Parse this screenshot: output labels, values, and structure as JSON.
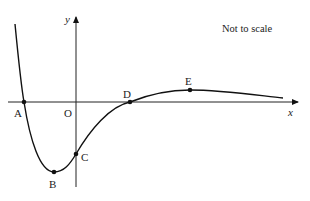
{
  "diagram": {
    "note": "Not to scale",
    "axes": {
      "x_label": "x",
      "y_label": "y",
      "origin_label": "O"
    },
    "points": [
      {
        "id": "A",
        "label": "A",
        "description": "x-intercept, left"
      },
      {
        "id": "B",
        "label": "B",
        "description": "local minimum"
      },
      {
        "id": "C",
        "label": "C",
        "description": "y-intercept"
      },
      {
        "id": "D",
        "label": "D",
        "description": "x-intercept, right"
      },
      {
        "id": "E",
        "label": "E",
        "description": "local maximum"
      }
    ],
    "colors": {
      "line": "#111111",
      "background": "#ffffff"
    }
  }
}
